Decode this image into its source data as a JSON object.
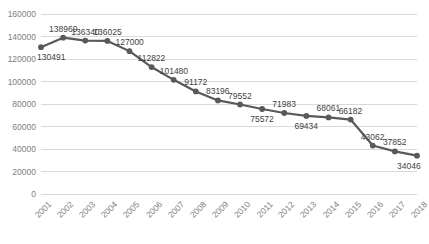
{
  "chart_data": {
    "type": "line",
    "title": "",
    "subtitle": "",
    "xlabel": "",
    "ylabel": "",
    "categories": [
      "2001",
      "2002",
      "2003",
      "2004",
      "2005",
      "2006",
      "2007",
      "2008",
      "2009",
      "2010",
      "2011",
      "2012",
      "2013",
      "2014",
      "2015",
      "2016",
      "2017",
      "2018"
    ],
    "values": [
      130491,
      138969,
      136340,
      136025,
      127000,
      112822,
      101480,
      91172,
      83196,
      79552,
      75572,
      71983,
      69434,
      68061,
      66182,
      43062,
      37852,
      34046
    ],
    "series": [
      {
        "name": "",
        "values": [
          130491,
          138969,
          136340,
          136025,
          127000,
          112822,
          101480,
          91172,
          83196,
          79552,
          75572,
          71983,
          69434,
          68061,
          66182,
          43062,
          37852,
          34046
        ]
      }
    ],
    "data_labels": [
      "130491",
      "138969",
      "136340",
      "136025",
      "127000",
      "112822",
      "101480",
      "91172",
      "83196",
      "79552",
      "75572",
      "71983",
      "69434",
      "68061",
      "66182",
      "43062",
      "37852",
      "34046"
    ],
    "label_positions": [
      "below",
      "above",
      "above",
      "above",
      "above",
      "above",
      "above",
      "above",
      "above",
      "above",
      "below",
      "above",
      "below",
      "above",
      "above",
      "above",
      "above",
      "below"
    ],
    "ylim": [
      0,
      160000
    ],
    "ytick_labels": [
      "160000",
      "140000",
      "120000",
      "100000",
      "80000",
      "60000",
      "40000",
      "20000",
      "0"
    ],
    "ytick_values": [
      160000,
      140000,
      120000,
      100000,
      80000,
      60000,
      40000,
      20000,
      0
    ],
    "grid": true,
    "grid_axis": "y",
    "legend": false,
    "legend_position": "none",
    "colors": {
      "line": "#595959",
      "marker": "#595959",
      "grid": "#d9d9d9",
      "tick_text": "#808080",
      "label_text": "#3f3f3f",
      "background": "#ffffff"
    },
    "xtick_rotation": -45
  }
}
